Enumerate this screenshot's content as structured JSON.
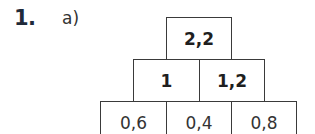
{
  "exercise": {
    "number": "1.",
    "part": "a)"
  },
  "pyramid": {
    "rows": [
      {
        "cells": [
          "2,2"
        ]
      },
      {
        "cells": [
          "1",
          "1,2"
        ]
      },
      {
        "cells": [
          "0,6",
          "0,4",
          "0,8"
        ]
      }
    ]
  }
}
